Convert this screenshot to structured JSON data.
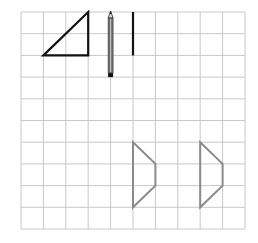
{
  "figure": {
    "width": 258,
    "height": 243,
    "background": "#ffffff"
  },
  "grid": {
    "columns": 10,
    "rows": 10,
    "left": 21,
    "top": 12,
    "right": 245,
    "bottom": 229,
    "line_color": "#c8c8c8",
    "line_width": 1
  },
  "shapes": {
    "triangle": {
      "description": "right triangle",
      "points_grid": [
        [
          1,
          2
        ],
        [
          3,
          0
        ],
        [
          3,
          2
        ]
      ],
      "stroke": "#111111",
      "stroke_width": 2.2
    },
    "vertical_segment": {
      "description": "vertical line segment",
      "points_grid": [
        [
          5,
          0
        ],
        [
          5,
          2
        ]
      ],
      "stroke": "#111111",
      "stroke_width": 2.2
    },
    "trapezoid_left": {
      "description": "trapezoid outline",
      "points_grid": [
        [
          5,
          6
        ],
        [
          6,
          7
        ],
        [
          6,
          8
        ],
        [
          5,
          9
        ]
      ],
      "stroke": "#8a8a8a",
      "stroke_width": 2
    },
    "trapezoid_right": {
      "description": "trapezoid outline",
      "points_grid": [
        [
          8,
          6
        ],
        [
          9,
          7
        ],
        [
          9,
          8
        ],
        [
          8,
          9
        ]
      ],
      "stroke": "#8a8a8a",
      "stroke_width": 2
    }
  },
  "pencil": {
    "grid_x": 4,
    "grid_y_top": 0,
    "grid_y_bottom": 3,
    "body_color": "#6e6e6e",
    "highlight_color": "#bdbdbd",
    "tip_color": "#222222",
    "end_color": "#111111"
  }
}
